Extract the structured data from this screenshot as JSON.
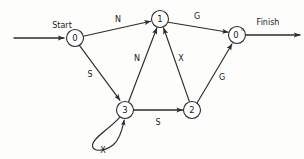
{
  "diagram": {
    "type": "state-transition-diagram",
    "title": "",
    "width": 304,
    "height": 159,
    "stroke_color": "#2b2b2b",
    "background_color": "#fdfdfc",
    "nodes": [
      {
        "id": "n0",
        "label": "0",
        "cx": 75,
        "cy": 38,
        "r": 8.5
      },
      {
        "id": "n1",
        "label": "1",
        "cx": 160,
        "cy": 19,
        "r": 8.5
      },
      {
        "id": "n0p",
        "label": "0",
        "cx": 237,
        "cy": 35,
        "r": 8.5,
        "prime": "'"
      },
      {
        "id": "n3",
        "label": "3",
        "cx": 125,
        "cy": 110,
        "r": 8.5
      },
      {
        "id": "n2",
        "label": "2",
        "cx": 192,
        "cy": 110,
        "r": 8.5
      }
    ],
    "terminals": [
      {
        "id": "start",
        "label": "Start",
        "x": 62,
        "y": 25
      },
      {
        "id": "finish",
        "label": "Finish",
        "x": 268,
        "y": 22
      }
    ],
    "edges": [
      {
        "id": "e-start-0",
        "from": "start",
        "to": "n0",
        "label": ""
      },
      {
        "id": "e-0-1",
        "from": "n0",
        "to": "n1",
        "label": "N",
        "lx": 118,
        "ly": 19
      },
      {
        "id": "e-0-3",
        "from": "n0",
        "to": "n3",
        "label": "S",
        "lx": 90,
        "ly": 74
      },
      {
        "id": "e-1-0p",
        "from": "n1",
        "to": "n0p",
        "label": "G",
        "lx": 197,
        "ly": 16
      },
      {
        "id": "e-3-1",
        "from": "n3",
        "to": "n1",
        "label": "N",
        "lx": 137,
        "ly": 58
      },
      {
        "id": "e-3-2",
        "from": "n3",
        "to": "n2",
        "label": "S",
        "lx": 158,
        "ly": 122
      },
      {
        "id": "e-3-3",
        "from": "n3",
        "to": "n3",
        "label": "X",
        "lx": 103,
        "ly": 150,
        "self_loop": true
      },
      {
        "id": "e-2-1",
        "from": "n2",
        "to": "n1",
        "label": "X",
        "lx": 181,
        "ly": 58
      },
      {
        "id": "e-2-0p",
        "from": "n2",
        "to": "n0p",
        "label": "G",
        "lx": 222,
        "ly": 77
      },
      {
        "id": "e-0p-finish",
        "from": "n0p",
        "to": "finish",
        "label": ""
      }
    ]
  }
}
